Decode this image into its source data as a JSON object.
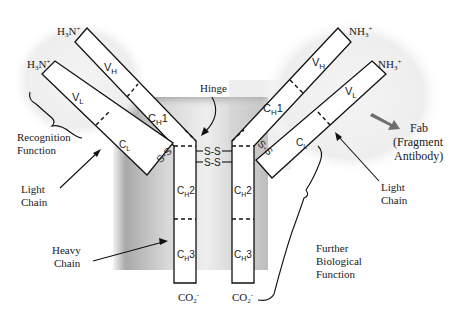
{
  "diagram": {
    "termini": {
      "left_heavy_n": "H3N+",
      "left_light_n": "H3N+",
      "right_heavy_n": "NH3+",
      "right_light_n": "NH3+",
      "left_c": "CO2-",
      "right_c": "CO2-"
    },
    "domains": {
      "vh": "V",
      "vh_sub": "H",
      "vl": "V",
      "vl_sub": "L",
      "ch1": "C",
      "ch1_sub": "H",
      "ch1_num": "1",
      "cl": "C",
      "cl_sub": "L",
      "ch2": "C",
      "ch2_sub": "H",
      "ch2_num": "2",
      "ch3": "C",
      "ch3_sub": "H",
      "ch3_num": "3"
    },
    "disulfide": {
      "hinge_bond": "S-S",
      "light_heavy_bond": "S-S"
    },
    "labels": {
      "hinge": "Hinge",
      "recognition": [
        "Recognition",
        "Function"
      ],
      "light_chain_left": [
        "Light",
        "Chain"
      ],
      "light_chain_right": [
        "Light",
        "Chain"
      ],
      "heavy_chain": [
        "Heavy",
        "Chain"
      ],
      "fab": [
        "Fab",
        "(Fragment",
        "Antibody)"
      ],
      "further": [
        "Further",
        "Biological",
        "Function"
      ]
    },
    "colors": {
      "fc_region_gray": "#9a9a9a",
      "fab_halo": "#ececec",
      "fab_arrow": "#6e6e6e",
      "line": "#111111"
    }
  }
}
